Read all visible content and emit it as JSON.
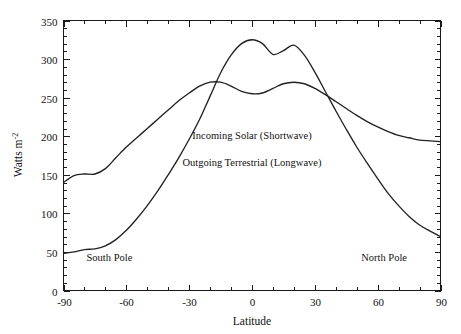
{
  "chart_data": {
    "type": "line",
    "title": "",
    "xlabel": "Latitude",
    "ylabel": "Watts m-2",
    "ylabel_base": "Watts m",
    "ylabel_exponent": "-2",
    "xlim": [
      -90,
      90
    ],
    "ylim": [
      0,
      350
    ],
    "xticks": [
      -90,
      -60,
      -30,
      0,
      30,
      60,
      90
    ],
    "xtick_labels": [
      "-90",
      "-60",
      "-30",
      "0",
      "30",
      "60",
      "90"
    ],
    "yticks": [
      0,
      50,
      100,
      150,
      200,
      250,
      300,
      350
    ],
    "ytick_labels": [
      "0",
      "50",
      "100",
      "150",
      "200",
      "250",
      "300",
      "350"
    ],
    "x_minor_step": 10,
    "y_minor_step": 10,
    "grid": false,
    "legend": "inline-annotations",
    "line_color": "#222222",
    "axis_color": "#1a1a1a",
    "background": "#ffffff",
    "series": [
      {
        "name": "Incoming Solar (Shortwave)",
        "x": [
          -90,
          -85,
          -80,
          -75,
          -70,
          -65,
          -60,
          -55,
          -50,
          -45,
          -40,
          -35,
          -30,
          -25,
          -20,
          -15,
          -10,
          -5,
          0,
          5,
          10,
          15,
          20,
          25,
          30,
          35,
          40,
          45,
          50,
          55,
          60,
          65,
          70,
          75,
          80,
          85,
          90
        ],
        "values": [
          48,
          50,
          53,
          54,
          58,
          66,
          78,
          93,
          110,
          129,
          150,
          172,
          196,
          222,
          252,
          282,
          305,
          320,
          325,
          320,
          306,
          311,
          318,
          305,
          283,
          258,
          233,
          209,
          186,
          165,
          145,
          126,
          110,
          96,
          85,
          77,
          70
        ]
      },
      {
        "name": "Outgoing Terrestrial (Longwave)",
        "x": [
          -90,
          -85,
          -80,
          -75,
          -70,
          -65,
          -60,
          -55,
          -50,
          -45,
          -40,
          -35,
          -30,
          -25,
          -20,
          -15,
          -10,
          -5,
          0,
          5,
          10,
          15,
          20,
          25,
          30,
          35,
          40,
          45,
          50,
          55,
          60,
          65,
          70,
          75,
          80,
          85,
          90
        ],
        "values": [
          140,
          149,
          151,
          151,
          158,
          172,
          186,
          198,
          210,
          222,
          234,
          246,
          256,
          265,
          270,
          270,
          265,
          258,
          255,
          256,
          262,
          268,
          270,
          268,
          262,
          254,
          245,
          236,
          227,
          219,
          212,
          206,
          201,
          198,
          195,
          194,
          193
        ]
      }
    ],
    "annotations": [
      {
        "text": "Incoming Solar (Shortwave)",
        "x": 0,
        "y": 197
      },
      {
        "text": "Outgoing Terrestrial (Longwave)",
        "x": 0,
        "y": 162
      },
      {
        "text": "South Pole",
        "x": -79,
        "y": 38
      },
      {
        "text": "North Pole",
        "x": 74,
        "y": 38
      }
    ]
  },
  "labels": {
    "x_axis_title": "Latitude",
    "y_axis_base": "Watts m",
    "y_axis_exponent": "-2",
    "annotation_solar": "Incoming Solar (Shortwave)",
    "annotation_terrestrial": "Outgoing Terrestrial (Longwave)",
    "south_pole": "South Pole",
    "north_pole": "North Pole"
  }
}
